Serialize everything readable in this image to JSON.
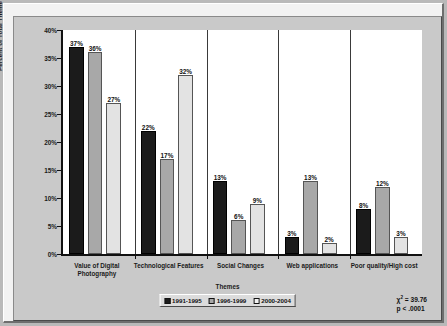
{
  "chart_data": {
    "type": "bar",
    "title": "",
    "xlabel": "Themes",
    "ylabel": "Percent of Total Theme Instances",
    "categories": [
      "Value of Digital Photography",
      "Technological Features",
      "Social Changes",
      "Web applications",
      "Poor quality/High cost"
    ],
    "series": [
      {
        "name": "1991-1995",
        "color": "#1b1b1b",
        "values": [
          37,
          22,
          13,
          3,
          8
        ],
        "labels": [
          "37%",
          "22%",
          "13%",
          "3%",
          "8%"
        ]
      },
      {
        "name": "1996-1999",
        "color": "#a8a8a8",
        "values": [
          36,
          17,
          6,
          13,
          12
        ],
        "labels": [
          "36%",
          "17%",
          "6%",
          "13%",
          "12%"
        ]
      },
      {
        "name": "2000-2004",
        "color": "#e3e3e3",
        "values": [
          27,
          32,
          9,
          2,
          3
        ],
        "labels": [
          "27%",
          "32%",
          "9%",
          "2%",
          "3%"
        ]
      }
    ],
    "ylim": [
      0,
      40
    ],
    "yticks": [
      0,
      5,
      10,
      15,
      20,
      25,
      30,
      35,
      40
    ],
    "ytick_labels": [
      "0%",
      "5%",
      "10%",
      "15%",
      "20%",
      "25%",
      "30%",
      "35%",
      "40%"
    ],
    "grid": false,
    "legend_position": "bottom-center"
  },
  "annotation": {
    "chi_symbol": "χ",
    "chi_exponent": "2",
    "chi_value": "= 39.76",
    "p_value": "p < .0001"
  },
  "colors": {
    "series_1991_1995": "#1b1b1b",
    "series_1996_1999": "#a8a8a8",
    "series_2000_2004": "#e3e3e3",
    "plot_background": "#ffffff",
    "panel_background": "#c9c9c9",
    "frame_background": "#f2f2f2"
  }
}
